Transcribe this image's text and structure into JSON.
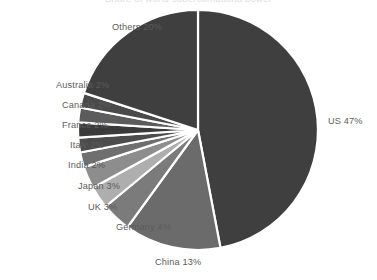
{
  "chart_data": {
    "type": "pie",
    "title": "Share of world supercomputing power",
    "categories": [
      "US",
      "China",
      "Germany",
      "UK",
      "Japan",
      "India",
      "Italy",
      "France",
      "Canada",
      "Australia",
      "Others"
    ],
    "values": [
      47,
      13,
      4,
      3,
      3,
      2,
      2,
      2,
      2,
      2,
      20
    ],
    "unit": "%",
    "labels": [
      "US 47%",
      "China 13%",
      "Germany 4%",
      "UK 3%",
      "Japan 3%",
      "India 2%",
      "Italy 2%",
      "France 2%",
      "Canada 2%",
      "Australia 2%",
      "Others 20%"
    ],
    "colors": [
      "#3f3f3f",
      "#6b6b6b",
      "#7b7b7b",
      "#aeaeae",
      "#8d8d8d",
      "#6f6f6f",
      "#4c4c4c",
      "#3a3a3a",
      "#5c5c5c",
      "#4a4a4a",
      "#3f3f3f"
    ],
    "start_angle_deg": 0,
    "direction": "clockwise",
    "separator_color": "#ffffff",
    "background": "#ffffff",
    "label_color": "#5b5b5b",
    "legend": "none",
    "grid": false,
    "xlabel": "",
    "ylabel": ""
  },
  "geometry": {
    "center_x": 198,
    "center_y": 130,
    "radius": 120
  },
  "label_positions": [
    {
      "key": "us",
      "x": 328,
      "y": 116,
      "align": "right"
    },
    {
      "key": "china",
      "x": 155,
      "y": 257,
      "align": "center"
    },
    {
      "key": "germany",
      "x": 116,
      "y": 222,
      "align": "left"
    },
    {
      "key": "uk",
      "x": 88,
      "y": 202,
      "align": "left"
    },
    {
      "key": "japan",
      "x": 78,
      "y": 181,
      "align": "left"
    },
    {
      "key": "india",
      "x": 68,
      "y": 160,
      "align": "left"
    },
    {
      "key": "italy",
      "x": 70,
      "y": 140,
      "align": "left"
    },
    {
      "key": "france",
      "x": 62,
      "y": 120,
      "align": "left"
    },
    {
      "key": "canada",
      "x": 62,
      "y": 100,
      "align": "left"
    },
    {
      "key": "australia",
      "x": 56,
      "y": 80,
      "align": "left"
    },
    {
      "key": "others",
      "x": 112,
      "y": 22,
      "align": "left"
    }
  ]
}
